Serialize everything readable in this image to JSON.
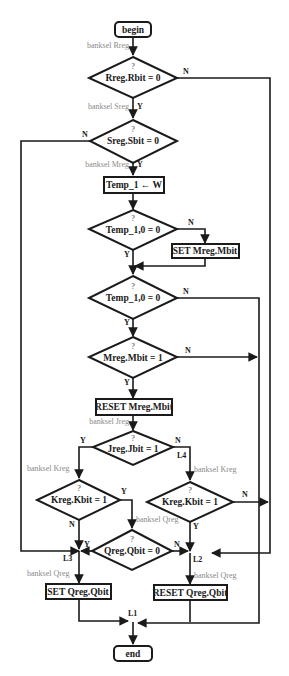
{
  "flowchart": {
    "terminals": {
      "begin": "begin",
      "end": "end"
    },
    "decisions": [
      {
        "id": "d1",
        "question": "?",
        "condition": "Rreg.Rbit = 0",
        "yes": "Y",
        "no": "N"
      },
      {
        "id": "d2",
        "question": "?",
        "condition": "Sreg.Sbit = 0",
        "yes": "Y",
        "no": "N"
      },
      {
        "id": "d3",
        "question": "?",
        "condition": "Temp_1,0 = 0",
        "yes": "Y",
        "no": "N"
      },
      {
        "id": "d4",
        "question": "?",
        "condition": "Temp_1,0 = 0",
        "yes": "Y",
        "no": "N"
      },
      {
        "id": "d5",
        "question": "?",
        "condition": "Mreg.Mbit = 1",
        "yes": "Y",
        "no": "N"
      },
      {
        "id": "d6",
        "question": "?",
        "condition": "Jreg.Jbit = 1",
        "yes": "Y",
        "no": "N"
      },
      {
        "id": "d7",
        "question": "?",
        "condition": "Kreg.Kbit = 1",
        "yes": "Y",
        "no": "N"
      },
      {
        "id": "d8",
        "question": "?",
        "condition": "Kreg.Kbit = 1",
        "yes": "Y",
        "no": "N"
      },
      {
        "id": "d9",
        "question": "?",
        "condition": "Qreg.Qbit = 0",
        "yes": "Y",
        "no": "N"
      }
    ],
    "processes": {
      "temp_assign": "Temp_1 ← W",
      "set_mreg": "SET Mreg.Mbit",
      "reset_mreg": "RESET Mreg.Mbit",
      "set_qreg": "SET Qreg.Qbit",
      "reset_qreg": "RESET Qreg.Qbit"
    },
    "banksel_notes": {
      "rreg": "banksel Rreg",
      "sreg": "banksel Sreg",
      "mreg": "banksel Mreg",
      "jreg": "banksel Jreg",
      "kreg_left": "banksel Kreg",
      "kreg_right": "banksel Kreg",
      "qreg_mid": "banksel Qreg",
      "qreg_left": "banksel Qreg",
      "qreg_right": "banksel Qreg"
    },
    "labels": {
      "l1": "L1",
      "l2": "L2",
      "l3": "L3",
      "l4": "L4"
    }
  }
}
